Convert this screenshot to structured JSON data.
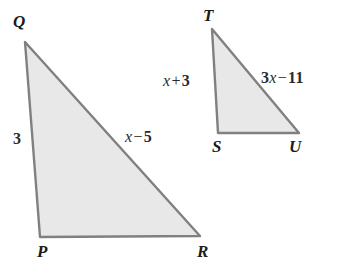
{
  "figure": {
    "kind": "geometry-diagram",
    "canvas": {
      "width": 352,
      "height": 268
    },
    "colors": {
      "background": "#ffffff",
      "triangle_fill": "#e8e8e8",
      "triangle_stroke": "#808080",
      "text": "#1b1b1b"
    }
  },
  "triangles": [
    {
      "name": "triangle-PQR",
      "vertices": [
        {
          "label": "Q",
          "x": 25,
          "y": 42
        },
        {
          "label": "P",
          "x": 40,
          "y": 237
        },
        {
          "label": "R",
          "x": 200,
          "y": 236
        }
      ],
      "side_labels": [
        {
          "name": "side-QP",
          "text": "3",
          "x": 16,
          "y": 140
        },
        {
          "name": "side-QR",
          "text": "x − 5",
          "x": 126,
          "y": 137
        }
      ]
    },
    {
      "name": "triangle-STU",
      "vertices": [
        {
          "label": "T",
          "x": 212,
          "y": 29
        },
        {
          "label": "S",
          "x": 218,
          "y": 133
        },
        {
          "label": "U",
          "x": 299,
          "y": 133
        }
      ],
      "side_labels": [
        {
          "name": "side-TS",
          "text": "x + 3",
          "x": 165,
          "y": 81
        },
        {
          "name": "side-TU",
          "text": "3x − 11",
          "x": 262,
          "y": 78
        }
      ]
    }
  ],
  "labels": {
    "Q": "Q",
    "P": "P",
    "R": "R",
    "T": "T",
    "S": "S",
    "U": "U",
    "side_qp": "3",
    "side_qr_var": "x",
    "side_qr_op": "−",
    "side_qr_num": "5",
    "side_ts_var": "x",
    "side_ts_op": "+",
    "side_ts_num": "3",
    "side_tu_coef": "3",
    "side_tu_var": "x",
    "side_tu_op": "−",
    "side_tu_num": "11"
  }
}
